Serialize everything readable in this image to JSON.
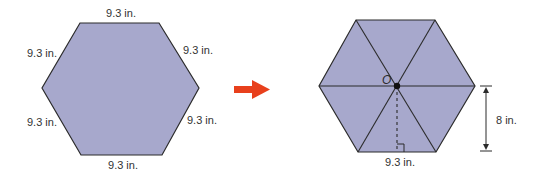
{
  "figure": {
    "left_hexagon": {
      "fill": "#a7a8cc",
      "stroke": "#2b2b2b",
      "labels": {
        "top": "9.3 in.",
        "upper_left": "9.3 in.",
        "upper_right": "9.3 in.",
        "lower_left": "9.3 in.",
        "lower_right": "9.3 in.",
        "bottom": "9.3 in."
      }
    },
    "arrow": {
      "color": "#e8401c",
      "direction": "right"
    },
    "right_hexagon": {
      "fill": "#a7a8cc",
      "stroke": "#2b2b2b",
      "center_label": "O",
      "side_label": "9.3 in.",
      "apothem_label": "8 in."
    }
  }
}
